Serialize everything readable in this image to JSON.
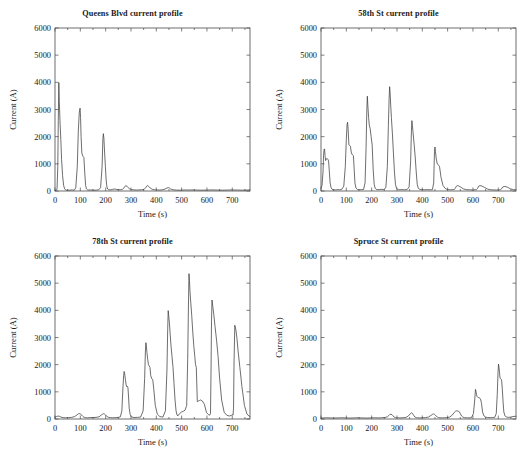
{
  "figure": {
    "width": 531,
    "height": 455,
    "background": "#ffffff",
    "line_color": "#3d3d3d",
    "axis_color": "#4a4a4a",
    "layout": "2x2 subplot grid"
  },
  "chart_data": [
    {
      "type": "line",
      "title": "Queens Blvd current profile",
      "xlabel": "Time (s)",
      "ylabel": "Current (A)",
      "xlim": [
        0,
        770
      ],
      "ylim": [
        0,
        6000
      ],
      "xticks": [
        0,
        100,
        200,
        300,
        400,
        500,
        600,
        700
      ],
      "yticks": [
        0,
        1000,
        2000,
        3000,
        4000,
        5000,
        6000
      ],
      "grid": false,
      "legend": "none",
      "series": [
        {
          "name": "Queens Blvd current",
          "x": [
            0,
            4,
            8,
            11,
            13,
            15,
            17,
            20,
            23,
            26,
            30,
            34,
            38,
            42,
            46,
            52,
            58,
            64,
            70,
            76,
            82,
            88,
            92,
            96,
            99,
            101,
            103,
            106,
            110,
            114,
            118,
            121,
            124,
            128,
            134,
            140,
            148,
            156,
            164,
            172,
            180,
            186,
            189,
            191,
            193,
            196,
            199,
            202,
            205,
            208,
            212,
            218,
            226,
            234,
            242,
            250,
            258,
            266,
            272,
            276,
            280,
            284,
            288,
            294,
            302,
            312,
            322,
            332,
            342,
            352,
            358,
            362,
            366,
            370,
            376,
            384,
            394,
            404,
            414,
            424,
            434,
            442,
            448,
            452,
            456,
            462,
            470,
            480,
            492,
            504,
            516,
            528,
            540,
            560,
            580,
            600,
            620,
            640,
            660,
            680,
            700,
            720,
            740,
            760,
            770
          ],
          "y": [
            20,
            30,
            60,
            900,
            2600,
            3990,
            3300,
            2500,
            1900,
            1150,
            560,
            210,
            80,
            40,
            30,
            35,
            30,
            40,
            35,
            30,
            120,
            900,
            2200,
            2900,
            3050,
            2700,
            2000,
            1400,
            1280,
            1240,
            600,
            200,
            80,
            45,
            35,
            40,
            35,
            30,
            35,
            40,
            120,
            900,
            1900,
            2110,
            1950,
            1400,
            900,
            400,
            150,
            70,
            45,
            40,
            55,
            75,
            60,
            50,
            45,
            60,
            110,
            170,
            195,
            180,
            130,
            80,
            55,
            40,
            35,
            40,
            45,
            60,
            120,
            180,
            200,
            170,
            110,
            60,
            45,
            40,
            35,
            45,
            70,
            110,
            125,
            110,
            80,
            55,
            40,
            35,
            30,
            35,
            40,
            35,
            40,
            35,
            30,
            35,
            40,
            35,
            30,
            35,
            40,
            35,
            30,
            35,
            40,
            40
          ]
        }
      ]
    },
    {
      "type": "line",
      "title": "58th St current profile",
      "xlabel": "Time (s)",
      "ylabel": "Current (A)",
      "xlim": [
        0,
        770
      ],
      "ylim": [
        0,
        6000
      ],
      "xticks": [
        0,
        100,
        200,
        300,
        400,
        500,
        600,
        700
      ],
      "yticks": [
        0,
        1000,
        2000,
        3000,
        4000,
        5000,
        6000
      ],
      "grid": false,
      "legend": "none",
      "series": [
        {
          "name": "58th St current",
          "x": [
            0,
            4,
            8,
            10,
            12,
            14,
            16,
            18,
            20,
            22,
            24,
            26,
            28,
            30,
            33,
            36,
            40,
            44,
            50,
            58,
            66,
            74,
            82,
            90,
            96,
            100,
            103,
            105,
            107,
            110,
            113,
            116,
            120,
            124,
            128,
            131,
            134,
            138,
            144,
            152,
            160,
            168,
            174,
            178,
            181,
            183,
            185,
            188,
            191,
            194,
            198,
            202,
            206,
            210,
            214,
            218,
            224,
            232,
            240,
            248,
            256,
            262,
            266,
            269,
            271,
            273,
            275,
            278,
            282,
            286,
            290,
            294,
            298,
            302,
            306,
            312,
            320,
            330,
            340,
            348,
            354,
            357,
            359,
            361,
            364,
            368,
            372,
            376,
            380,
            384,
            390,
            398,
            408,
            420,
            432,
            440,
            445,
            448,
            450,
            452,
            455,
            459,
            463,
            468,
            474,
            482,
            492,
            502,
            512,
            520,
            526,
            530,
            534,
            538,
            544,
            552,
            562,
            574,
            586,
            598,
            608,
            614,
            618,
            622,
            628,
            636,
            646,
            658,
            670,
            682,
            694,
            702,
            708,
            712,
            718,
            726,
            736,
            748,
            760,
            770
          ],
          "y": [
            120,
            200,
            700,
            1300,
            1520,
            1550,
            1300,
            1120,
            1150,
            1190,
            1200,
            1180,
            1150,
            1100,
            700,
            300,
            120,
            60,
            45,
            40,
            50,
            45,
            60,
            180,
            900,
            1900,
            2450,
            2530,
            2300,
            1700,
            1680,
            1650,
            1400,
            1330,
            1300,
            800,
            300,
            110,
            55,
            45,
            50,
            55,
            300,
            1600,
            3000,
            3490,
            3150,
            2700,
            2400,
            2310,
            2000,
            1700,
            800,
            250,
            100,
            60,
            50,
            55,
            60,
            55,
            120,
            900,
            2400,
            3400,
            3840,
            3600,
            3200,
            2700,
            2100,
            1400,
            700,
            250,
            100,
            60,
            50,
            45,
            50,
            45,
            50,
            150,
            1100,
            2200,
            2590,
            2400,
            2100,
            1700,
            1250,
            700,
            250,
            100,
            60,
            50,
            45,
            50,
            45,
            50,
            300,
            1400,
            1620,
            1450,
            1200,
            1000,
            970,
            900,
            500,
            200,
            80,
            50,
            45,
            50,
            55,
            90,
            170,
            200,
            185,
            140,
            80,
            50,
            45,
            40,
            45,
            50,
            90,
            175,
            200,
            180,
            130,
            70,
            45,
            40,
            35,
            40,
            45,
            70,
            150,
            170,
            140,
            80,
            50,
            45,
            50,
            50
          ]
        }
      ]
    },
    {
      "type": "line",
      "title": "78th St current profile",
      "xlabel": "Time (s)",
      "ylabel": "Current (A)",
      "xlim": [
        0,
        770
      ],
      "ylim": [
        0,
        6000
      ],
      "xticks": [
        0,
        100,
        200,
        300,
        400,
        500,
        600,
        700
      ],
      "yticks": [
        0,
        1000,
        2000,
        3000,
        4000,
        5000,
        6000
      ],
      "grid": false,
      "legend": "none",
      "series": [
        {
          "name": "78th St current",
          "x": [
            0,
            6,
            12,
            18,
            24,
            32,
            42,
            54,
            66,
            78,
            88,
            94,
            98,
            102,
            106,
            110,
            114,
            120,
            128,
            138,
            150,
            162,
            174,
            182,
            188,
            192,
            196,
            200,
            204,
            210,
            218,
            228,
            240,
            250,
            258,
            264,
            268,
            271,
            273,
            275,
            278,
            281,
            284,
            286,
            288,
            290,
            293,
            297,
            302,
            308,
            316,
            326,
            338,
            348,
            354,
            357,
            359,
            361,
            363,
            366,
            369,
            372,
            375,
            378,
            382,
            386,
            390,
            396,
            404,
            414,
            426,
            436,
            442,
            445,
            447,
            449,
            452,
            455,
            458,
            462,
            466,
            470,
            474,
            478,
            482,
            486,
            492,
            500,
            508,
            514,
            520,
            524,
            527,
            529,
            531,
            533,
            536,
            540,
            544,
            548,
            552,
            555,
            558,
            562,
            566,
            570,
            575,
            582,
            590,
            598,
            606,
            611,
            614,
            616,
            618,
            620,
            623,
            627,
            632,
            638,
            644,
            650,
            658,
            668,
            678,
            688,
            696,
            700,
            703,
            705,
            707,
            710,
            714,
            718,
            723,
            730,
            738,
            748,
            758,
            766,
            770
          ],
          "y": [
            60,
            90,
            110,
            95,
            70,
            50,
            45,
            50,
            60,
            90,
            160,
            200,
            195,
            175,
            140,
            95,
            65,
            50,
            45,
            50,
            55,
            60,
            80,
            140,
            180,
            195,
            180,
            145,
            100,
            65,
            50,
            45,
            50,
            60,
            80,
            300,
            1100,
            1600,
            1750,
            1680,
            1450,
            1250,
            1180,
            1200,
            1150,
            880,
            400,
            160,
            80,
            60,
            55,
            60,
            70,
            300,
            1500,
            2500,
            2810,
            2650,
            2450,
            2200,
            2000,
            1950,
            1900,
            1600,
            1480,
            1450,
            1100,
            500,
            180,
            90,
            70,
            300,
            1800,
            3300,
            3990,
            3800,
            3500,
            3100,
            2700,
            2300,
            1900,
            1300,
            700,
            300,
            140,
            120,
            200,
            260,
            290,
            330,
            500,
            2200,
            4200,
            5350,
            5100,
            4700,
            4300,
            3800,
            3200,
            2700,
            2300,
            2000,
            1900,
            640,
            660,
            680,
            700,
            660,
            540,
            240,
            160,
            140,
            200,
            1700,
            3600,
            4380,
            4150,
            3850,
            3400,
            2900,
            2300,
            1500,
            700,
            250,
            140,
            110,
            130,
            160,
            140,
            400,
            2100,
            3450,
            3300,
            3000,
            2500,
            1900,
            1200,
            500,
            180,
            110,
            90,
            110,
            130,
            130
          ]
        }
      ]
    },
    {
      "type": "line",
      "title": "Spruce St current profile",
      "xlabel": "Time (s)",
      "ylabel": "Current (A)",
      "xlim": [
        0,
        770
      ],
      "ylim": [
        0,
        6000
      ],
      "xticks": [
        0,
        100,
        200,
        300,
        400,
        500,
        600,
        700
      ],
      "yticks": [
        0,
        1000,
        2000,
        3000,
        4000,
        5000,
        6000
      ],
      "grid": false,
      "legend": "none",
      "series": [
        {
          "name": "Spruce St current",
          "x": [
            0,
            10,
            22,
            36,
            50,
            66,
            82,
            98,
            114,
            130,
            146,
            162,
            178,
            194,
            210,
            226,
            240,
            252,
            262,
            268,
            272,
            276,
            280,
            284,
            288,
            294,
            302,
            312,
            324,
            336,
            346,
            353,
            357,
            360,
            363,
            367,
            371,
            376,
            382,
            390,
            400,
            412,
            424,
            434,
            441,
            445,
            448,
            451,
            455,
            459,
            464,
            470,
            478,
            488,
            498,
            508,
            518,
            526,
            532,
            536,
            539,
            542,
            546,
            550,
            555,
            560,
            566,
            574,
            584,
            594,
            602,
            607,
            610,
            612,
            614,
            616,
            619,
            622,
            625,
            628,
            631,
            634,
            638,
            643,
            650,
            658,
            668,
            678,
            686,
            692,
            696,
            699,
            701,
            703,
            705,
            707,
            710,
            713,
            716,
            719,
            722,
            726,
            731,
            738,
            746,
            754,
            762,
            770
          ],
          "y": [
            35,
            40,
            45,
            40,
            35,
            40,
            45,
            40,
            35,
            40,
            45,
            40,
            35,
            40,
            45,
            40,
            45,
            55,
            80,
            130,
            170,
            175,
            160,
            120,
            75,
            50,
            45,
            40,
            45,
            60,
            120,
            200,
            230,
            215,
            180,
            120,
            70,
            50,
            45,
            40,
            45,
            50,
            70,
            130,
            175,
            185,
            175,
            150,
            110,
            70,
            50,
            45,
            40,
            45,
            50,
            70,
            140,
            240,
            290,
            300,
            295,
            290,
            270,
            200,
            110,
            70,
            50,
            45,
            40,
            50,
            200,
            700,
            1090,
            1010,
            900,
            830,
            800,
            790,
            780,
            760,
            700,
            560,
            260,
            120,
            70,
            55,
            50,
            55,
            60,
            200,
            900,
            1700,
            2020,
            1900,
            1700,
            1500,
            1480,
            1450,
            1100,
            620,
            260,
            120,
            80,
            60,
            65,
            80,
            95,
            100,
            100
          ]
        }
      ]
    }
  ]
}
